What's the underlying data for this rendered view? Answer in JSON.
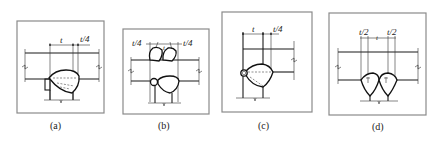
{
  "panels": [
    {
      "id": "a",
      "caption": "(a)",
      "dims": {
        "t": "t",
        "t4": "t/4"
      }
    },
    {
      "id": "b",
      "caption": "(b)",
      "dims": {
        "t4_left": "t/4",
        "t4_right": "t/4",
        "t": "t"
      }
    },
    {
      "id": "c",
      "caption": "(c)",
      "dims": {
        "t": "t",
        "t4": "t/4"
      }
    },
    {
      "id": "d",
      "caption": "(d)",
      "dims": {
        "t2_left": "t/2",
        "t": "t",
        "t2_right": "t/2"
      }
    }
  ]
}
